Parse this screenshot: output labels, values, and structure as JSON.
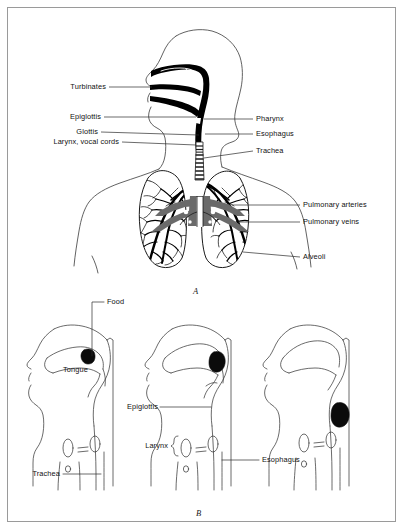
{
  "figure": {
    "panels": [
      {
        "letter": "A",
        "name": "respiratory-tract-overview",
        "labels": [
          {
            "id": "turbinates",
            "text": "Turbinates",
            "side": "left"
          },
          {
            "id": "epiglottis",
            "text": "Epiglottis",
            "side": "left"
          },
          {
            "id": "glottis",
            "text": "Glottis",
            "side": "left"
          },
          {
            "id": "larynx-vocal-cords",
            "text": "Larynx, vocal cords",
            "side": "left"
          },
          {
            "id": "pharynx",
            "text": "Pharynx",
            "side": "right"
          },
          {
            "id": "esophagus",
            "text": "Esophagus",
            "side": "right"
          },
          {
            "id": "trachea",
            "text": "Trachea",
            "side": "right"
          },
          {
            "id": "pulmonary-arteries",
            "text": "Pulmonary arteries",
            "side": "right"
          },
          {
            "id": "pulmonary-veins",
            "text": "Pulmonary veins",
            "side": "right"
          },
          {
            "id": "alveoli",
            "text": "Alveoli",
            "side": "right"
          }
        ]
      },
      {
        "letter": "B",
        "name": "swallowing-sequence",
        "labels": [
          {
            "id": "food",
            "text": "Food",
            "side": "right"
          },
          {
            "id": "tongue",
            "text": "Tongue",
            "side": "none"
          },
          {
            "id": "trachea-b",
            "text": "Trachea",
            "side": "left"
          },
          {
            "id": "epiglottis-b",
            "text": "Epiglottis",
            "side": "left"
          },
          {
            "id": "larynx-b",
            "text": "Larynx",
            "side": "left"
          },
          {
            "id": "esophagus-b",
            "text": "Esophagus",
            "side": "right"
          }
        ]
      }
    ],
    "colors": {
      "outline": "#1a1a1a",
      "body_outline": "#3a3a3a",
      "airway_fill": "#000000",
      "vessel_gray": "#6a6a6a",
      "leader": "#2b2b2b",
      "border": "#9a9a9a",
      "background": "#ffffff"
    }
  }
}
